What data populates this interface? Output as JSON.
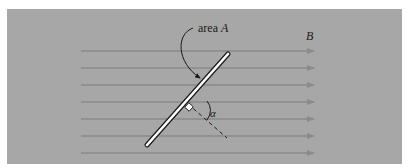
{
  "diagram": {
    "type": "magnetic-flux-through-tilted-area",
    "background_color": "#a7a7a7",
    "field_line_color": "#8a8a8a",
    "labels": {
      "area_prefix": "area ",
      "area_symbol": "A",
      "field_symbol": "B",
      "angle_symbol": "α"
    },
    "field_lines": {
      "count": 7,
      "x_start": 81,
      "x_end": 314,
      "y_positions": [
        51,
        68,
        85,
        102,
        119,
        136,
        153
      ]
    },
    "plate": {
      "x1": 147,
      "y1": 145,
      "x2": 228,
      "y2": 54
    },
    "normal_line": {
      "style": "dashed",
      "x1": 188,
      "y1": 104,
      "x2": 227,
      "y2": 138
    }
  }
}
